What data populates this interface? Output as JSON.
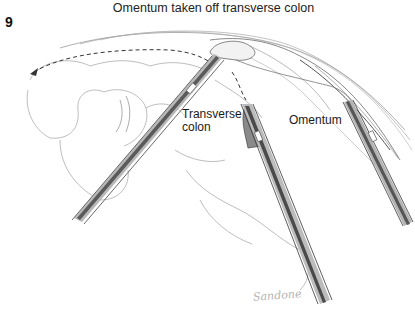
{
  "figure": {
    "number": "9",
    "title": "Omentum taken off transverse colon"
  },
  "labels": {
    "transverse_colon": [
      "Transverse",
      "colon"
    ],
    "omentum": "Omentum"
  },
  "signature": "Sandone",
  "colors": {
    "background": "#ffffff",
    "text": "#1a1a1a",
    "pencil_dark": "#3a3a3a",
    "pencil_mid": "#8a8a8a",
    "pencil_light": "#c8c8c8"
  }
}
